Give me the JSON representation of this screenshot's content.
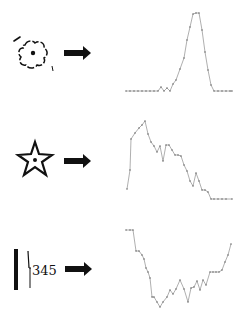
{
  "rows": [
    {
      "id": "flower",
      "icon": "flower-outline-with-dot-icon",
      "arrow": "right-arrow-icon",
      "plot_label": "single-peak-profile"
    },
    {
      "id": "star",
      "icon": "star-outline-with-dot-icon",
      "arrow": "right-arrow-icon",
      "plot_label": "early-peak-decay-profile"
    },
    {
      "id": "bar-text",
      "icon": "vertical-bar-icon",
      "icon_text": "345",
      "arrow": "right-arrow-icon",
      "plot_label": "valley-profile"
    }
  ],
  "colors": {
    "ink": "#111111",
    "plot_line": "#9a9a9a",
    "plot_point": "#6f6f6f",
    "background": "#ffffff"
  },
  "chart_data": [
    {
      "type": "line",
      "title": "",
      "xlabel": "",
      "ylabel": "",
      "grid": false,
      "legend": "none",
      "x": [
        126,
        130,
        134,
        138,
        142,
        146,
        150,
        154,
        158,
        161,
        164,
        167,
        170,
        173,
        176,
        180,
        184,
        187,
        190,
        193,
        196,
        199,
        202,
        205,
        208,
        211,
        214,
        218,
        222,
        226,
        230,
        232
      ],
      "values": [
        91,
        91,
        91,
        91,
        91,
        91,
        91,
        91,
        91,
        87,
        91,
        88,
        91,
        84,
        80,
        69,
        58,
        40,
        27,
        14,
        13,
        13,
        30,
        52,
        70,
        85,
        91,
        91,
        91,
        91,
        91,
        91
      ]
    },
    {
      "type": "line",
      "title": "",
      "xlabel": "",
      "ylabel": "",
      "grid": false,
      "legend": "none",
      "x": [
        127,
        130,
        131,
        135,
        139,
        142,
        145,
        148,
        151,
        154,
        157,
        160,
        163,
        166,
        169,
        172,
        175,
        178,
        181,
        184,
        187,
        190,
        193,
        196,
        199,
        202,
        205,
        208,
        211,
        214,
        218,
        222,
        226,
        232
      ],
      "values": [
        189,
        170,
        139,
        133,
        128,
        125,
        121,
        134,
        142,
        146,
        152,
        146,
        161,
        145,
        145,
        150,
        155,
        155,
        156,
        165,
        171,
        181,
        186,
        173,
        181,
        190,
        190,
        192,
        199,
        199,
        199,
        199,
        199,
        199
      ]
    },
    {
      "type": "line",
      "title": "",
      "xlabel": "",
      "ylabel": "",
      "grid": false,
      "legend": "none",
      "x": [
        126,
        130,
        133,
        136,
        139,
        142,
        144,
        146,
        148,
        150,
        152,
        154,
        157,
        160,
        163,
        167,
        170,
        173,
        176,
        180,
        184,
        188,
        191,
        194,
        197,
        200,
        203,
        206,
        210,
        213,
        216,
        219,
        222,
        225,
        228,
        231
      ],
      "values": [
        230,
        230,
        230,
        251,
        251,
        255,
        259,
        268,
        272,
        278,
        297,
        297,
        302,
        307,
        302,
        297,
        290,
        294,
        289,
        280,
        289,
        302,
        288,
        287,
        281,
        290,
        280,
        285,
        272,
        272,
        272,
        272,
        270,
        262,
        255,
        244
      ]
    }
  ]
}
